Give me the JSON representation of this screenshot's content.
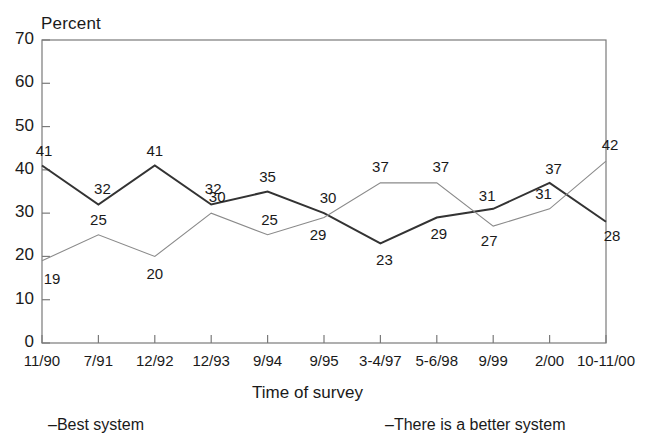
{
  "chart_data": {
    "type": "line",
    "title": "",
    "ylabel": "Percent",
    "xlabel": "Time of survey",
    "categories": [
      "11/90",
      "7/91",
      "12/92",
      "12/93",
      "9/94",
      "9/95",
      "3-4/97",
      "5-6/98",
      "9/99",
      "2/00",
      "10-11/00"
    ],
    "ylim": [
      0,
      70
    ],
    "yticks": [
      0,
      10,
      20,
      30,
      40,
      50,
      60,
      70
    ],
    "grid": false,
    "legend_position": "bottom",
    "series": [
      {
        "name": "Best system",
        "legend_label": "–Best system",
        "color": "#333333",
        "width": 2.0,
        "values": [
          41,
          32,
          41,
          32,
          35,
          30,
          23,
          29,
          31,
          37,
          28
        ],
        "labels": [
          "41",
          "32",
          "41",
          "32",
          "35",
          "30",
          "23",
          "29",
          "31",
          "37",
          "28"
        ]
      },
      {
        "name": "There is a better system",
        "legend_label": "–There is a better system",
        "color": "#8a8a8a",
        "width": 1.1,
        "values": [
          19,
          25,
          20,
          30,
          25,
          29,
          37,
          37,
          27,
          31,
          42
        ],
        "labels": [
          "19",
          "25",
          "20",
          "30",
          "25",
          "29",
          "37",
          "37",
          "27",
          "31",
          "42"
        ]
      }
    ]
  },
  "axis": {
    "y_title": "Percent",
    "x_title": "Time of survey",
    "y_tick_labels": [
      "70",
      "60",
      "50",
      "40",
      "30",
      "20",
      "10",
      "0"
    ],
    "x_tick_labels": [
      "11/90",
      "7/91",
      "12/92",
      "12/93",
      "9/94",
      "9/95",
      "3-4/97",
      "5-6/98",
      "9/99",
      "2/00",
      "10-11/00"
    ]
  },
  "legend": {
    "best": "–Best system",
    "better": "–There is a better system"
  },
  "value_labels": {
    "best": [
      "41",
      "32",
      "41",
      "32",
      "35",
      "30",
      "23",
      "29",
      "31",
      "37",
      "28"
    ],
    "better": [
      "19",
      "25",
      "20",
      "30",
      "25",
      "29",
      "37",
      "37",
      "27",
      "31",
      "42"
    ]
  },
  "colors": {
    "best_line": "#333333",
    "better_line": "#8a8a8a",
    "frame": "#7a7a7a",
    "text": "#1a1a1a",
    "background": "#ffffff"
  }
}
